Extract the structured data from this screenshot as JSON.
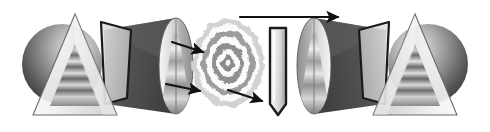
{
  "figure": {
    "width": 490,
    "height": 132,
    "background_color": "#ffffff",
    "caption": "",
    "symmetry": "mirror-symmetric about vertical center axis",
    "palette": {
      "background": "#ffffff",
      "outline_dark": "#1a1a1a",
      "outline_thin": "#6b6b6b",
      "sphere_dark": "#3a3a3a",
      "sphere_mid": "#777777",
      "sphere_light": "#d8d8d8",
      "cone_dark": "#4a4a4a",
      "cone_mid": "#8a8a8a",
      "cone_light": "#ededed",
      "band_dark": "#5a5a5a",
      "band_light": "#f2f2f2",
      "rings_ink": "#8c8c8c",
      "arrow_color": "#111111"
    },
    "elements": [
      {
        "id": "sphere-left",
        "name": "shaded-sphere-left",
        "type": "sphere",
        "cx": 62,
        "cy": 64,
        "r": 40,
        "shading": "radial highlight upper-right, dark limb lower-left"
      },
      {
        "id": "triangle-left",
        "name": "outlined-triangle-left",
        "type": "triangle",
        "apex": [
          75,
          14
        ],
        "base_left": [
          33,
          115
        ],
        "base_right": [
          117,
          115
        ],
        "fill": "light gradient",
        "stroke": "#6b6b6b"
      },
      {
        "id": "inner-triangle-left",
        "name": "banded-inner-triangle-left",
        "type": "triangle",
        "apex": [
          75,
          44
        ],
        "base_left": [
          50,
          106
        ],
        "base_right": [
          100,
          106
        ],
        "fill": "horizontal gray bands"
      },
      {
        "id": "prism-left",
        "name": "tilted-prism-quadrilateral-left",
        "type": "quadrilateral",
        "points": [
          [
            101,
            22
          ],
          [
            131,
            30
          ],
          [
            127,
            98
          ],
          [
            105,
            104
          ]
        ],
        "stroke": "#1a1a1a",
        "stroke_width": 2.2
      },
      {
        "id": "cone-left",
        "name": "cone-wedge-left",
        "type": "cone",
        "apex": [
          104,
          30
        ],
        "base_center": [
          176,
          66
        ],
        "base_rx": 16,
        "base_ry": 48,
        "fill": "dark gray gradient"
      },
      {
        "id": "ellipse-face-left",
        "name": "elliptical-beam-face-left",
        "type": "ellipse",
        "cx": 176,
        "cy": 66,
        "rx": 17,
        "ry": 48,
        "fill": "light vertical gradient"
      },
      {
        "id": "rings",
        "name": "concentric-diffraction-rings",
        "type": "concentric-rings",
        "cx": 228,
        "cy": 63,
        "ring_count": 5,
        "outer_radius": 38,
        "description": "Airy-like diffraction pattern with soft ragged outer edge"
      },
      {
        "id": "crystal-center",
        "name": "vertical-crystal-prism-center",
        "type": "hexagon-elongated",
        "points": [
          [
            270,
            28
          ],
          [
            286,
            28
          ],
          [
            286,
            104
          ],
          [
            278,
            115
          ],
          [
            270,
            104
          ]
        ],
        "stroke": "#1a1a1a",
        "stroke_width": 2.4
      },
      {
        "id": "ellipse-face-right",
        "name": "elliptical-beam-face-right",
        "type": "ellipse",
        "cx": 314,
        "cy": 66,
        "rx": 17,
        "ry": 48,
        "fill": "light vertical gradient"
      },
      {
        "id": "cone-right",
        "name": "cone-wedge-right",
        "type": "cone",
        "apex": [
          386,
          30
        ],
        "base_center": [
          314,
          66
        ],
        "base_rx": 16,
        "base_ry": 48,
        "fill": "dark gray gradient"
      },
      {
        "id": "prism-right",
        "name": "tilted-prism-quadrilateral-right",
        "type": "quadrilateral",
        "points": [
          [
            389,
            22
          ],
          [
            359,
            30
          ],
          [
            363,
            98
          ],
          [
            385,
            104
          ]
        ],
        "stroke": "#1a1a1a",
        "stroke_width": 2.2
      },
      {
        "id": "triangle-right",
        "name": "outlined-triangle-right",
        "type": "triangle",
        "apex": [
          415,
          14
        ],
        "base_left": [
          373,
          115
        ],
        "base_right": [
          457,
          115
        ],
        "fill": "light gradient",
        "stroke": "#6b6b6b"
      },
      {
        "id": "inner-triangle-right",
        "name": "banded-inner-triangle-right",
        "type": "triangle",
        "apex": [
          415,
          44
        ],
        "base_left": [
          390,
          106
        ],
        "base_right": [
          440,
          106
        ],
        "fill": "horizontal gray bands"
      },
      {
        "id": "sphere-right",
        "name": "shaded-sphere-right",
        "type": "sphere",
        "cx": 428,
        "cy": 64,
        "r": 40,
        "shading": "radial highlight upper-left, dark limb lower-right"
      }
    ],
    "arrows": [
      {
        "id": "arrow-upper-diagonal-left",
        "name": "arrow-upper-diagonal-left",
        "from": [
          172,
          42
        ],
        "to": [
          203,
          52
        ],
        "direction": "right-down",
        "label": ""
      },
      {
        "id": "arrow-lower-diagonal-left",
        "name": "arrow-lower-diagonal-left",
        "from": [
          166,
          84
        ],
        "to": [
          200,
          91
        ],
        "direction": "right-down",
        "label": ""
      },
      {
        "id": "arrow-lower-diagonal-center",
        "name": "arrow-lower-diagonal-center",
        "from": [
          228,
          90
        ],
        "to": [
          262,
          101
        ],
        "direction": "right-down",
        "label": ""
      },
      {
        "id": "arrow-top-horizontal",
        "name": "arrow-top-horizontal-long",
        "from": [
          240,
          17
        ],
        "to": [
          338,
          17
        ],
        "direction": "right",
        "label": ""
      }
    ]
  }
}
